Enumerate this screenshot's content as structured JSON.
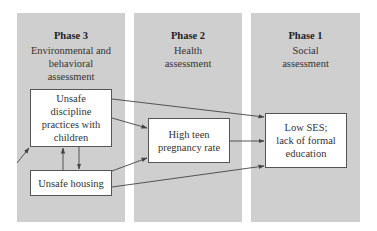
{
  "panels": [
    {
      "title": "Phase 3",
      "subtitle": "Environmental and behavioral assessment"
    },
    {
      "title": "Phase 2",
      "subtitle": "Health assessment"
    },
    {
      "title": "Phase 1",
      "subtitle": "Social assessment"
    }
  ],
  "nodes": {
    "discipline": "Unsafe discipline practices with children",
    "housing": "Unsafe housing",
    "pregnancy": "High teen pregnancy rate",
    "ses": "Low SES; lack of formal education"
  },
  "edges": [
    {
      "from": "external",
      "to": "discipline"
    },
    {
      "from": "discipline",
      "to": "housing"
    },
    {
      "from": "housing",
      "to": "discipline"
    },
    {
      "from": "discipline",
      "to": "pregnancy"
    },
    {
      "from": "discipline",
      "to": "ses"
    },
    {
      "from": "housing",
      "to": "pregnancy"
    },
    {
      "from": "housing",
      "to": "ses"
    },
    {
      "from": "pregnancy",
      "to": "ses"
    }
  ],
  "colors": {
    "panel": "#cfcfcf",
    "box": "#ffffff",
    "line": "#444444"
  }
}
